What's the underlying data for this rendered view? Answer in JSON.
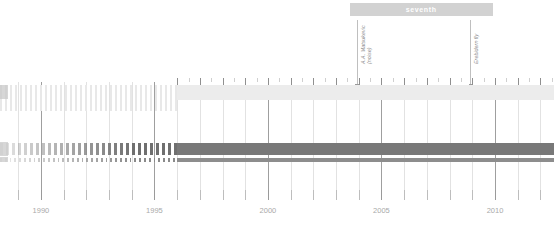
{
  "chart_data": {
    "type": "bar",
    "title": "",
    "subtitle": "",
    "xlabel": "",
    "ylabel": "",
    "orientation": "horizontal-timeline",
    "xlim": [
      1988.2,
      2012.6
    ],
    "grid": true,
    "legend_position": "none",
    "x_tick_labels": [
      "1990",
      "1995",
      "2000",
      "2005",
      "2010"
    ],
    "x_tick_values": [
      1990,
      1995,
      2000,
      2005,
      2010
    ],
    "x_minor_tick_values": [
      1989,
      1991,
      1992,
      1993,
      1994,
      1996,
      1997,
      1998,
      1999,
      2001,
      2002,
      2003,
      2004,
      2006,
      2007,
      2008,
      2009,
      2011,
      2012
    ],
    "series": [
      {
        "name": "light-coverage-band",
        "color": "#ececec",
        "style": "solid",
        "x_start": 1996.0,
        "x_end": 2012.6,
        "row": 0
      },
      {
        "name": "pale-intermittent-band",
        "color": "#e8e8e8",
        "style": "dashed",
        "x_start": 1988.2,
        "x_end": 1996.0,
        "row": 0
      },
      {
        "name": "primary-record-thick",
        "color": "#787878",
        "style": "solid",
        "x_start": 1996.0,
        "x_end": 2012.6,
        "row": 1
      },
      {
        "name": "primary-record-thick-intermittent",
        "color": "#6f6f6f",
        "style": "dashed",
        "x_start": 1988.2,
        "x_end": 1996.0,
        "row": 1
      },
      {
        "name": "secondary-record-thin",
        "color": "#8d8d8d",
        "style": "solid",
        "x_start": 1996.0,
        "x_end": 2012.6,
        "row": 2
      },
      {
        "name": "secondary-record-thin-intermittent",
        "color": "#8a8a8a",
        "style": "dashed",
        "x_start": 1988.2,
        "x_end": 1996.0,
        "row": 2
      }
    ],
    "period_bars": [
      {
        "label": "seventh",
        "x_start": 2003.6,
        "x_end": 2009.9,
        "color": "#d2d2d2",
        "text_color": "#ffffff"
      }
    ],
    "annotations": [
      {
        "id": "annotation-left",
        "line1": "A.A. Matsukevic",
        "line2": "(noise)",
        "x_value": 2003.9,
        "color": "#8c8c8c"
      },
      {
        "id": "annotation-right",
        "line1": "Erebidern fly",
        "line2": "",
        "x_value": 2008.9,
        "color": "#8c8c8c"
      }
    ]
  },
  "period": {
    "seventh_label": "seventh"
  },
  "annotations": {
    "left": {
      "line1": "A.A. Matsukevic",
      "line2": "(noise)"
    },
    "right": {
      "line1": "Erebidern fly",
      "line2": ""
    }
  },
  "axis": {
    "labels": [
      "1990",
      "1995",
      "2000",
      "2005",
      "2010"
    ]
  },
  "colors": {
    "period_bar": "#d2d2d2",
    "light_band": "#ececec",
    "thick_bar": "#787878",
    "thin_bar": "#8d8d8d",
    "gridline_major": "#9f9f9f",
    "gridline_minor": "#e2e2e2",
    "axis_text": "#a9a9a9",
    "annotation_text": "#8c8c8c"
  }
}
